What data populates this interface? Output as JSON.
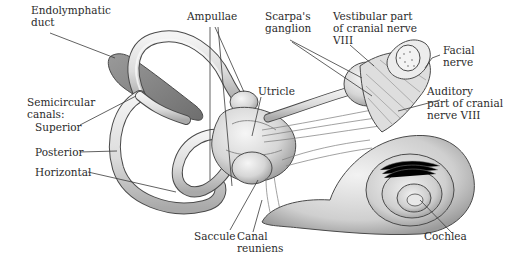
{
  "diagram": {
    "labels": {
      "endolymphatic_duct": "Endolymphatic\nduct",
      "ampullae": "Ampullae",
      "scarpas_ganglion": "Scarpa's\nganglion",
      "vestibular_nerve": "Vestibular part\nof cranial nerve\nVIII",
      "facial_nerve": "Facial\nnerve",
      "utricle": "Utricle",
      "semicircular_canals": "Semicircular\ncanals:",
      "superior": "Superior",
      "posterior": "Posterior",
      "horizontal": "Horizontal",
      "auditory_nerve": "Auditory\npart of cranial\nnerve VIII",
      "saccule": "Saccule",
      "canal_reuniens": "Canal\nreuniens",
      "cochlea": "Cochlea"
    },
    "colors": {
      "tissue_fill": "#e4e4e4",
      "tissue_shade": "#b8b8b8",
      "duct_dark": "#8a8a8a",
      "outline": "#4a4a4a",
      "leader_line": "#3a3a3a",
      "text": "#2b2b2b"
    }
  }
}
